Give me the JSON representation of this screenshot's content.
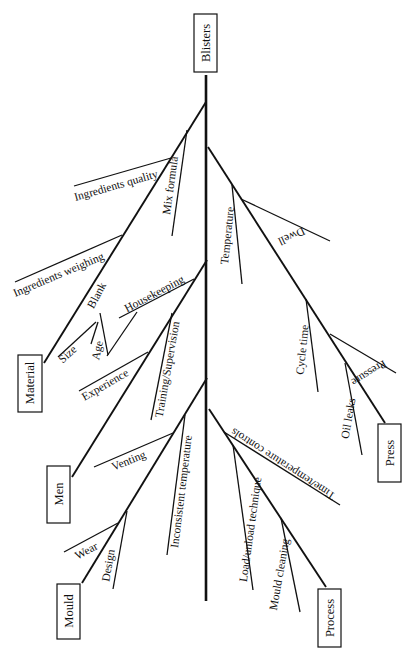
{
  "diagram": {
    "type": "fishbone",
    "effect": {
      "label": "Blisters",
      "box": [
        194,
        14,
        23,
        58
      ],
      "cx": 205.5,
      "cy": 43,
      "rot": -90
    },
    "spine": {
      "x1": 206,
      "y1": 75,
      "x2": 206,
      "y2": 601
    },
    "categories": [
      {
        "label": "Material",
        "box": [
          18,
          355,
          24,
          57
        ],
        "cx": 30,
        "cy": 383,
        "rot": -90,
        "bone": [
          206,
          102,
          44,
          363
        ],
        "causes": [
          {
            "label": "Ingredients quality",
            "line": [
              171,
              158,
              74,
              186
            ],
            "tx": 117,
            "ty": 189,
            "rot": -16
          },
          {
            "label": "Mix formula",
            "line": [
              187,
              130,
              172,
              236
            ],
            "tx": 174,
            "ty": 186,
            "rot": -82
          },
          {
            "label": "Ingredients weighing",
            "line": [
              122,
              235,
              15,
              282
            ],
            "tx": 60,
            "ty": 278,
            "rot": -23
          },
          {
            "label": "Blank",
            "line": [
              137,
              312,
              107,
              356
            ],
            "tx": 100,
            "ty": 297,
            "rot": -62
          },
          {
            "label": "Size",
            "line": [
              96,
              322,
              58,
              357
            ],
            "tx": 70,
            "ty": 357,
            "rot": -42
          },
          {
            "label": "Age",
            "line": [
              98,
              322,
              91,
              344
            ],
            "tx": 101,
            "ty": 351,
            "rot": -78
          },
          {
            "label": "",
            "line": [
              100,
              313,
              108,
              355
            ],
            "tx": 0,
            "ty": 0,
            "rot": 0
          }
        ]
      },
      {
        "label": "Men",
        "box": [
          47,
          466,
          23,
          57
        ],
        "cx": 58.5,
        "cy": 494,
        "rot": -90,
        "bone": [
          207,
          260,
          72,
          477
        ],
        "causes": [
          {
            "label": "Housekeeping",
            "line": [
              194,
              279,
              119,
              318
            ],
            "tx": 156,
            "ty": 297,
            "rot": -28
          },
          {
            "label": "Training/Supervision",
            "line": [
              172,
              313,
              151,
              420
            ],
            "tx": 171,
            "ty": 370,
            "rot": -80
          },
          {
            "label": "Experience",
            "line": [
              148,
              352,
              79,
              391
            ],
            "tx": 107,
            "ty": 388,
            "rot": -30
          }
        ]
      },
      {
        "label": "Mould",
        "box": [
          57,
          584,
          23,
          55
        ],
        "cx": 68.5,
        "cy": 611,
        "rot": -90,
        "bone": [
          207,
          378,
          82,
          583
        ],
        "causes": [
          {
            "label": "Venting",
            "line": [
              173,
              433,
              94,
              467
            ],
            "tx": 130,
            "ty": 464,
            "rot": -22
          },
          {
            "label": "Inconsistent temperature",
            "line": [
              185,
              415,
              167,
              555
            ],
            "tx": 185,
            "ty": 492,
            "rot": -83
          },
          {
            "label": "Wear",
            "line": [
              118,
              523,
              64,
              552
            ],
            "tx": 88,
            "ty": 554,
            "rot": -28
          },
          {
            "label": "Design",
            "line": [
              127,
              511,
              113,
              589
            ],
            "tx": 112,
            "ty": 566,
            "rot": -80
          }
        ]
      },
      {
        "label": "Press",
        "box": [
          378,
          424,
          23,
          58
        ],
        "cx": 389.5,
        "cy": 453,
        "rot": -90,
        "bone": [
          208,
          147,
          385,
          423
        ],
        "causes": [
          {
            "label": "Temperature",
            "line": [
              232,
              185,
              242,
              284
            ],
            "tx": 231,
            "ty": 236,
            "rot": -84
          },
          {
            "label": "Dwell",
            "line": [
              241,
              199,
              330,
              241
            ],
            "tx": 290,
            "ty": 233,
            "rot": 155
          },
          {
            "label": "Cycle time",
            "line": [
              306,
              299,
              318,
              392
            ],
            "tx": 306,
            "ty": 350,
            "rot": -84
          },
          {
            "label": "Pressure",
            "line": [
              330,
              334,
              396,
              373
            ],
            "tx": 367,
            "ty": 370,
            "rot": 148
          },
          {
            "label": "Oil leaks",
            "line": [
              345,
              363,
              362,
              455
            ],
            "tx": 352,
            "ty": 419,
            "rot": -80
          }
        ]
      },
      {
        "label": "Process",
        "box": [
          318,
          589,
          23,
          58
        ],
        "cx": 329.5,
        "cy": 618,
        "rot": -90,
        "bone": [
          209,
          409,
          326,
          587
        ],
        "causes": [
          {
            "label": "Time/temperature controls",
            "line": [
              224,
              432,
              340,
              505
            ],
            "tx": 285,
            "ty": 461,
            "rot": 213
          },
          {
            "label": "Load/unload technique",
            "line": [
              233,
              445,
              253,
              590
            ],
            "tx": 254,
            "ty": 530,
            "rot": -82
          },
          {
            "label": "Mould cleaning",
            "line": [
              281,
              518,
              300,
              612
            ],
            "tx": 283,
            "ty": 575,
            "rot": -80
          }
        ]
      }
    ]
  }
}
